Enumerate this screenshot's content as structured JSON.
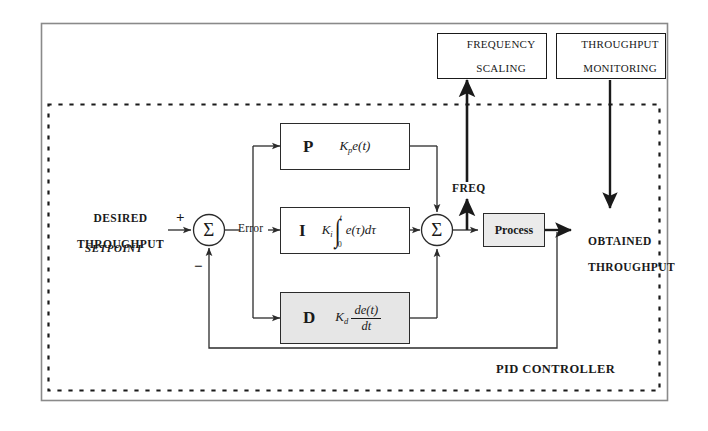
{
  "diagram": {
    "outer_frame": {
      "name": "outer-frame"
    },
    "pid_boundary_label": "PID CONTROLLER"
  },
  "top_boxes": [
    {
      "id": "frequency-scaling",
      "line1": "FREQUENCY",
      "line2": "SCALING"
    },
    {
      "id": "throughput-monitoring",
      "line1": "THROUGHPUT",
      "line2": "MONITORING"
    }
  ],
  "inputs": {
    "desired_line1": "DESIRED",
    "desired_line2": "THROUGHPUT",
    "setpoint": "SETPOINT",
    "plus_sign": "+",
    "minus_sign": "−"
  },
  "junctions": {
    "error_sum": "Σ",
    "output_sum": "Σ",
    "error_label": "Error"
  },
  "pid_blocks": [
    {
      "id": "proportional",
      "letter": "P",
      "formula_parts": {
        "gain": "K",
        "gain_sub": "p",
        "expr": "e(t)"
      },
      "formula_text": "Kp e(t)",
      "shaded": false
    },
    {
      "id": "integral",
      "letter": "I",
      "formula_parts": {
        "gain": "K",
        "gain_sub": "i",
        "integral_upper": "t",
        "integral_lower": "0",
        "expr": "e(τ)dτ"
      },
      "formula_text": "Ki ∫0t e(τ)dτ",
      "shaded": false
    },
    {
      "id": "derivative",
      "letter": "D",
      "formula_parts": {
        "gain": "K",
        "gain_sub": "d",
        "numerator": "de(t)",
        "denominator": "dt"
      },
      "formula_text": "Kd de(t)/dt",
      "shaded": true
    }
  ],
  "plant": {
    "label": "Process"
  },
  "signals": {
    "freq": "FREQ",
    "obtained_line1": "OBTAINED",
    "obtained_line2": "THROUGHPUT"
  },
  "colors": {
    "ink": "#1a1a1a",
    "line": "#2b2b2b",
    "shade": "#e6e6e6",
    "process_shade": "#ebebeb",
    "frame": "#8a8a8a",
    "background": "#ffffff"
  }
}
